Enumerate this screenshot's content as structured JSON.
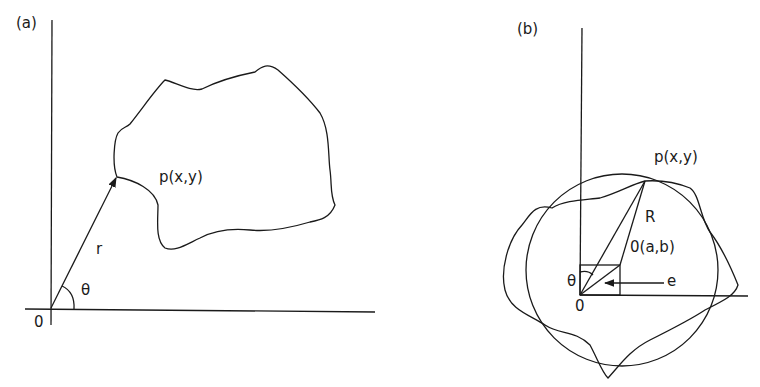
{
  "figure": {
    "panel_a": {
      "tag": "(a)",
      "origin_label": "0",
      "radius_label": "r",
      "angle_label": "θ",
      "point_label": "p(x,y)"
    },
    "panel_b": {
      "tag": "(b)",
      "origin_label": "0",
      "angle_label": "θ",
      "point_label": "p(x,y)",
      "radius_label": "R",
      "center_label": "0(a,b)",
      "eccentricity_label": "e"
    }
  },
  "colors": {
    "stroke": "#1a1a1a",
    "background": "#ffffff"
  }
}
